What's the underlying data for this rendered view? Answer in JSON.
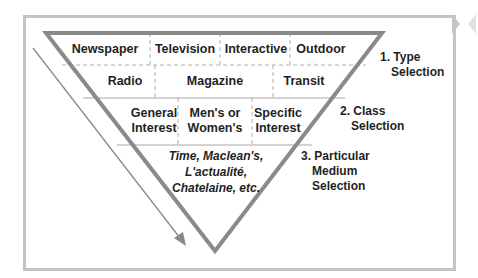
{
  "diagram": {
    "colors": {
      "frame": "#c4c4c4",
      "triangle_stroke": "#8a8a8a",
      "divider": "#b0b0b0",
      "arrow": "#8a8a8a",
      "text": "#1f1f1f"
    },
    "rows": [
      {
        "level": "type",
        "cells": [
          "Newspaper",
          "Television",
          "Interactive",
          "Outdoor"
        ]
      },
      {
        "level": "type",
        "cells": [
          "Radio",
          "Magazine",
          "Transit"
        ]
      },
      {
        "level": "class",
        "cells": [
          {
            "line1": "General",
            "line2": "Interest"
          },
          {
            "line1": "Men's or",
            "line2": "Women's"
          },
          {
            "line1": "Specific",
            "line2": "Interest"
          }
        ]
      },
      {
        "level": "medium",
        "lines": [
          "Time, Maclean's,",
          "L'actualité,",
          "Chatelaine, etc."
        ]
      }
    ],
    "steps": [
      {
        "number": "1.",
        "line1": "Type",
        "line2": "Selection"
      },
      {
        "number": "2.",
        "line1": "Class",
        "line2": "Selection"
      },
      {
        "number": "3.",
        "line1": "Particular",
        "line2": "Medium",
        "line3": "Selection"
      }
    ],
    "arrow": {
      "direction": "down-right",
      "meaning": "progression-of-selection"
    }
  }
}
